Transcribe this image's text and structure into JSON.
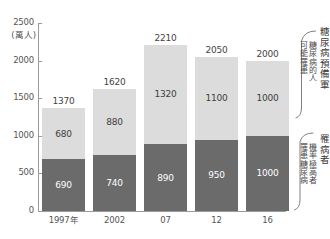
{
  "chart_data": {
    "type": "bar",
    "title": "",
    "subtitle": "",
    "xlabel": "",
    "ylabel": "",
    "yunit": "(萬人)",
    "ylim": [
      0,
      2500
    ],
    "ytick_labels": [
      "2500",
      "2000",
      "1500",
      "1000",
      "500",
      "0"
    ],
    "ytick_values": [
      2500,
      2000,
      1500,
      1000,
      500,
      0
    ],
    "grid": false,
    "stacked": true,
    "legend_position": "right",
    "categories": [
      "1997年",
      "2002",
      "07",
      "12",
      "16"
    ],
    "series": [
      {
        "name": "罹病者",
        "description": "罹患糖尿病機率極高者",
        "color": "#6b6b6b",
        "values": [
          690,
          740,
          890,
          950,
          1000
        ]
      },
      {
        "name": "糖尿病預備軍",
        "description": "可能罹患糖尿病的人",
        "color": "#dcdcdc",
        "values": [
          680,
          880,
          1320,
          1100,
          1000
        ]
      }
    ],
    "totals": [
      1370,
      1620,
      2210,
      2050,
      2000
    ]
  },
  "axis": {
    "unit_label": "(萬人)",
    "ticks": [
      {
        "label": "2500",
        "value": 2500
      },
      {
        "label": "2000",
        "value": 2000
      },
      {
        "label": "1500",
        "value": 1500
      },
      {
        "label": "1000",
        "value": 1000
      },
      {
        "label": "500",
        "value": 500
      },
      {
        "label": "0",
        "value": 0
      }
    ]
  },
  "bars": [
    {
      "category": "1997年",
      "total_label": "1370",
      "upper_label": "680",
      "lower_label": "690",
      "total": 1370,
      "upper": 680,
      "lower": 690
    },
    {
      "category": "2002",
      "total_label": "1620",
      "upper_label": "880",
      "lower_label": "740",
      "total": 1620,
      "upper": 880,
      "lower": 740
    },
    {
      "category": "07",
      "total_label": "2210",
      "upper_label": "1320",
      "lower_label": "890",
      "total": 2210,
      "upper": 1320,
      "lower": 890
    },
    {
      "category": "12",
      "total_label": "2050",
      "upper_label": "1100",
      "lower_label": "950",
      "total": 2050,
      "upper": 1100,
      "lower": 950
    },
    {
      "category": "16",
      "total_label": "2000",
      "upper_label": "1000",
      "lower_label": "1000",
      "total": 2000,
      "upper": 1000,
      "lower": 1000
    }
  ],
  "legend": {
    "upper": {
      "title": "糖尿病預備軍",
      "sub_line_1": "可能罹患",
      "sub_line_2": "糖尿病的人"
    },
    "lower": {
      "title": "罹病者",
      "sub_line_1": "罹患糖尿病",
      "sub_line_2": "機率極高者"
    }
  },
  "colors": {
    "upper_segment": "#dcdcdc",
    "lower_segment": "#6b6b6b",
    "axis": "#9a9a9a",
    "background": "#ffffff"
  }
}
